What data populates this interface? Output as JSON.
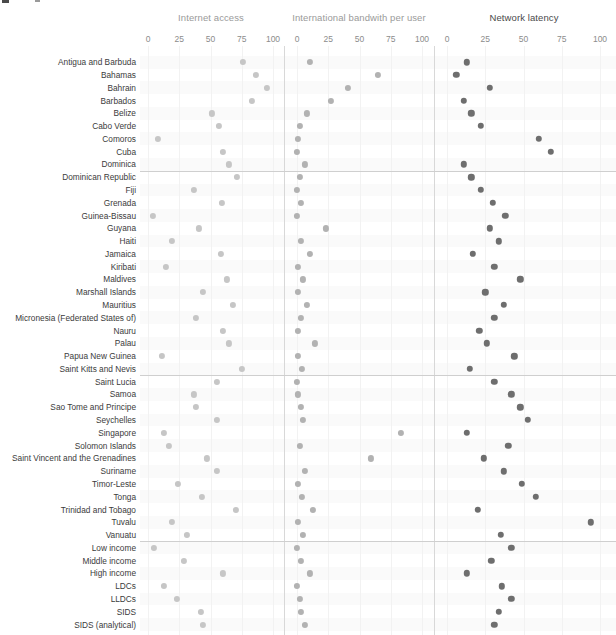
{
  "chart_data": {
    "type": "scatter",
    "title": "",
    "subtitle": "",
    "layout": "small-multiples-dot-plot",
    "xlabel": "",
    "ylabel": "",
    "xlim": [
      0,
      100
    ],
    "xticks": [
      0,
      25,
      50,
      75,
      100
    ],
    "grid": true,
    "legend_position": "none",
    "panels": [
      {
        "name": "Internet access",
        "color": "#c6c6c6"
      },
      {
        "name": "International bandwith per user",
        "color": "#b2b2b2"
      },
      {
        "name": "Network latency",
        "color": "#6e6e6e"
      }
    ],
    "categories": [
      "Antigua and Barbuda",
      "Bahamas",
      "Bahrain",
      "Barbados",
      "Belize",
      "Cabo Verde",
      "Comoros",
      "Cuba",
      "Dominica",
      "Dominican Republic",
      "Fiji",
      "Grenada",
      "Guinea-Bissau",
      "Guyana",
      "Haiti",
      "Jamaica",
      "Kiribati",
      "Maldives",
      "Marshall Islands",
      "Mauritius",
      "Micronesia (Federated States of)",
      "Nauru",
      "Palau",
      "Papua New Guinea",
      "Saint Kitts and Nevis",
      "Saint Lucia",
      "Samoa",
      "Sao Tome and Principe",
      "Seychelles",
      "Singapore",
      "Solomon Islands",
      "Saint Vincent and the Grenadines",
      "Suriname",
      "Timor-Leste",
      "Tonga",
      "Trinidad and Tobago",
      "Tuvalu",
      "Vanuatu",
      "Low income",
      "Middle income",
      "High income",
      "LDCs",
      "LLDCs",
      "SIDS",
      "SIDS (analytical)"
    ],
    "group_separators_after": [
      "Dominica",
      "Saint Kitts and Nevis",
      "Vanuatu"
    ],
    "series": [
      {
        "name": "Internet access",
        "values": [
          76,
          86,
          95,
          83,
          51,
          57,
          8,
          60,
          65,
          71,
          37,
          59,
          4,
          41,
          19,
          58,
          14,
          63,
          44,
          68,
          38,
          60,
          65,
          11,
          75,
          55,
          37,
          38,
          55,
          13,
          17,
          47,
          55,
          24,
          43,
          70,
          19,
          31,
          5,
          29,
          60,
          13,
          23,
          42,
          44
        ]
      },
      {
        "name": "International bandwith per user",
        "values": [
          10,
          65,
          41,
          27,
          8,
          2,
          1,
          0,
          6,
          2,
          0,
          3,
          0,
          23,
          3,
          10,
          1,
          5,
          1,
          8,
          3,
          1,
          14,
          1,
          4,
          0,
          1,
          3,
          5,
          83,
          2,
          59,
          6,
          1,
          4,
          13,
          1,
          5,
          0,
          3,
          10,
          0,
          2,
          3,
          6
        ]
      },
      {
        "name": "Network latency",
        "values": [
          13,
          6,
          28,
          11,
          16,
          22,
          60,
          68,
          11,
          16,
          22,
          30,
          38,
          28,
          34,
          17,
          31,
          48,
          25,
          37,
          31,
          21,
          26,
          44,
          15,
          31,
          42,
          48,
          53,
          13,
          40,
          24,
          37,
          49,
          58,
          20,
          94,
          35,
          42,
          29,
          13,
          36,
          42,
          34,
          31
        ]
      }
    ]
  },
  "header": {
    "panel_titles": [
      "Internet access",
      "International bandwith per user",
      "Network latency"
    ],
    "axis_ticks": [
      "0",
      "25",
      "50",
      "75",
      "100"
    ]
  }
}
